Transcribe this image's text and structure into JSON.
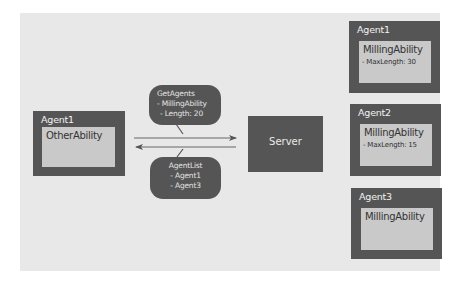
{
  "diagram": {
    "left_agent": {
      "title": "Agent1",
      "ability": "OtherAbility"
    },
    "server": {
      "label": "Server"
    },
    "request_bubble": {
      "lines": [
        "GetAgents",
        "- MillingAbility",
        "- Length: 20"
      ]
    },
    "response_bubble": {
      "lines": [
        "AgentList",
        "- Agent1",
        "- Agent3"
      ]
    },
    "right_agents": [
      {
        "title": "Agent1",
        "ability": "MillingAbility",
        "param": "- MaxLength: 30"
      },
      {
        "title": "Agent2",
        "ability": "MillingAbility",
        "param": "- MaxLength: 15"
      },
      {
        "title": "Agent3",
        "ability": "MillingAbility",
        "param": ""
      }
    ],
    "arrows": [
      {
        "from": "left_agent",
        "to": "server",
        "label_ref": "request_bubble"
      },
      {
        "from": "server",
        "to": "left_agent",
        "label_ref": "response_bubble"
      }
    ],
    "colors": {
      "background_panel": "#e8e8e8",
      "node_fill": "#555555",
      "inner_box_fill": "#c9c9c9",
      "node_text": "#f2f2f2",
      "inner_text": "#333333"
    }
  }
}
